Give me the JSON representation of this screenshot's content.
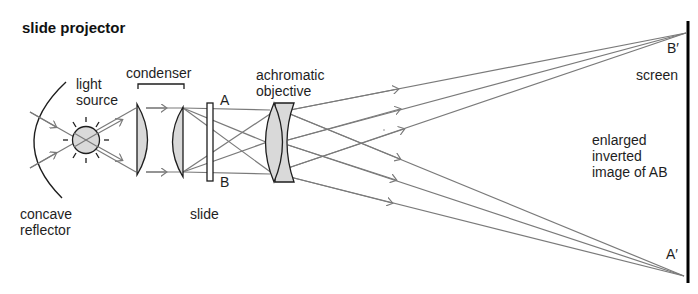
{
  "title": "slide projector",
  "labels": {
    "light_source": "light\nsource",
    "condenser": "condenser",
    "achromatic_objective": "achromatic\nobjective",
    "point_a": "A",
    "point_b": "B",
    "slide": "slide",
    "concave_reflector": "concave\nreflector",
    "b_prime": "B′",
    "a_prime": "A′",
    "screen": "screen",
    "image_caption": "enlarged\ninverted\nimage of AB"
  },
  "colors": {
    "ray": "#7a7a7a",
    "outline": "#1e1e1e",
    "glass_fill": "#d9d9d9",
    "screen": "#000000"
  }
}
